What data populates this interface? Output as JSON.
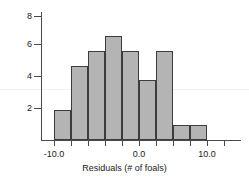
{
  "chart_data": {
    "type": "bar",
    "title": "",
    "xlabel": "Residuals (# of foals)",
    "ylabel": "",
    "categories": [
      "-9.0",
      "-7.0",
      "-5.0",
      "-3.0",
      "-1.0",
      "1.0",
      "3.0",
      "5.0",
      "7.0"
    ],
    "bin_edges": [
      -8.0,
      -6.0,
      -4.0,
      -2.0,
      0.0,
      2.0,
      4.0,
      6.0,
      8.0,
      10.0
    ],
    "values": [
      2,
      5,
      6,
      7,
      6,
      4,
      6,
      1,
      1
    ],
    "xlim": [
      -11.5,
      13.5
    ],
    "ylim": [
      0,
      8.6
    ],
    "x_ticks": [
      -10.0,
      0.0,
      10.0
    ],
    "x_tick_labels": [
      "-10.0",
      "0.0",
      "10.0"
    ],
    "y_ticks": [
      2,
      4,
      6,
      8
    ],
    "y_tick_labels": [
      "2",
      "4",
      "6",
      "8"
    ],
    "grid": false,
    "legend": "none",
    "bar_fill_color": "#b4b4b4",
    "bar_edge_color": "#3c3c3c",
    "axis_color": "#4a4a4a",
    "background_color": "#ffffff"
  },
  "axis": {
    "x_title": "Residuals (# of foals)"
  },
  "y_labels": {
    "t0": "2",
    "t1": "4",
    "t2": "6",
    "t3": "8"
  },
  "x_labels": {
    "t0": "-10.0",
    "t1": "0.0",
    "t2": "10.0"
  }
}
